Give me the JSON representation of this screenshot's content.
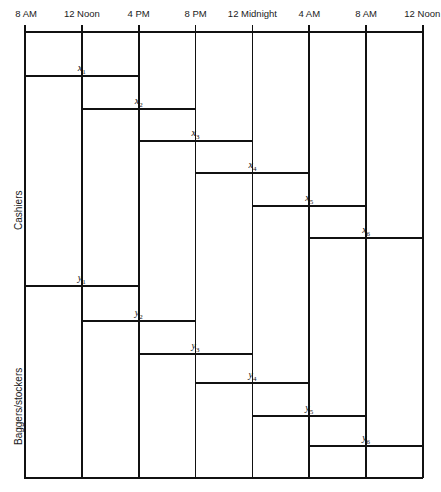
{
  "chart_data": {
    "type": "bar",
    "title": "",
    "subtitle": "",
    "xlabel": "",
    "ylabel": "",
    "orientation": "horizontal",
    "grid": true,
    "legend_position": "none",
    "x_axis": {
      "position": "top",
      "ticks": [
        {
          "label": "8 AM",
          "value": 0
        },
        {
          "label": "12 Noon",
          "value": 4
        },
        {
          "label": "4 PM",
          "value": 8
        },
        {
          "label": "8 PM",
          "value": 12
        },
        {
          "label": "12 Midnight",
          "value": 16
        },
        {
          "label": "4 AM",
          "value": 20
        },
        {
          "label": "8 AM",
          "value": 24
        },
        {
          "label": "12 Noon",
          "value": 28
        }
      ],
      "xlim": [
        0,
        28
      ],
      "unit": "hours"
    },
    "groups": [
      {
        "name": "Cashiers",
        "label": "Cashiers",
        "series": [
          {
            "name": "x1",
            "label": "x",
            "subscript": "1",
            "start": 0,
            "end": 8,
            "start_time": "8 AM",
            "end_time": "4 PM"
          },
          {
            "name": "x2",
            "label": "x",
            "subscript": "2",
            "start": 4,
            "end": 12,
            "start_time": "12 Noon",
            "end_time": "8 PM"
          },
          {
            "name": "x3",
            "label": "x",
            "subscript": "3",
            "start": 8,
            "end": 16,
            "start_time": "4 PM",
            "end_time": "12 Midnight"
          },
          {
            "name": "x4",
            "label": "x",
            "subscript": "4",
            "start": 12,
            "end": 20,
            "start_time": "8 PM",
            "end_time": "4 AM"
          },
          {
            "name": "x5",
            "label": "x",
            "subscript": "5",
            "start": 16,
            "end": 24,
            "start_time": "12 Midnight",
            "end_time": "8 AM"
          },
          {
            "name": "x6",
            "label": "x",
            "subscript": "6",
            "start": 20,
            "end": 28,
            "start_time": "4 AM",
            "end_time": "12 Noon"
          }
        ]
      },
      {
        "name": "Baggers/stockers",
        "label": "Baggers/stockers",
        "series": [
          {
            "name": "y1",
            "label": "y",
            "subscript": "1",
            "start": 0,
            "end": 8,
            "start_time": "8 AM",
            "end_time": "4 PM"
          },
          {
            "name": "y2",
            "label": "y",
            "subscript": "2",
            "start": 4,
            "end": 12,
            "start_time": "12 Noon",
            "end_time": "8 PM"
          },
          {
            "name": "y3",
            "label": "y",
            "subscript": "3",
            "start": 8,
            "end": 16,
            "start_time": "4 PM",
            "end_time": "12 Midnight"
          },
          {
            "name": "y4",
            "label": "y",
            "subscript": "4",
            "start": 12,
            "end": 20,
            "start_time": "8 PM",
            "end_time": "4 AM"
          },
          {
            "name": "y5",
            "label": "y",
            "subscript": "5",
            "start": 16,
            "end": 24,
            "start_time": "12 Midnight",
            "end_time": "8 AM"
          },
          {
            "name": "y6",
            "label": "y",
            "subscript": "6",
            "start": 20,
            "end": 28,
            "start_time": "4 AM",
            "end_time": "12 Noon"
          }
        ]
      }
    ],
    "colors": {
      "line": "#111111",
      "background": "#ffffff",
      "text": "#1a1a1a"
    }
  },
  "geometry": {
    "plot_left": 25,
    "plot_right": 423,
    "plot_top": 31,
    "plot_bottom": 478,
    "tick_spacing": 56.857,
    "bar_rows_y": [
      75,
      108,
      140,
      172,
      205,
      237,
      285,
      320,
      353,
      382,
      415,
      445
    ],
    "row_label_positions": [
      {
        "group": 0,
        "x": 13,
        "y": 230
      },
      {
        "group": 1,
        "x": 13,
        "y": 445
      }
    ]
  }
}
